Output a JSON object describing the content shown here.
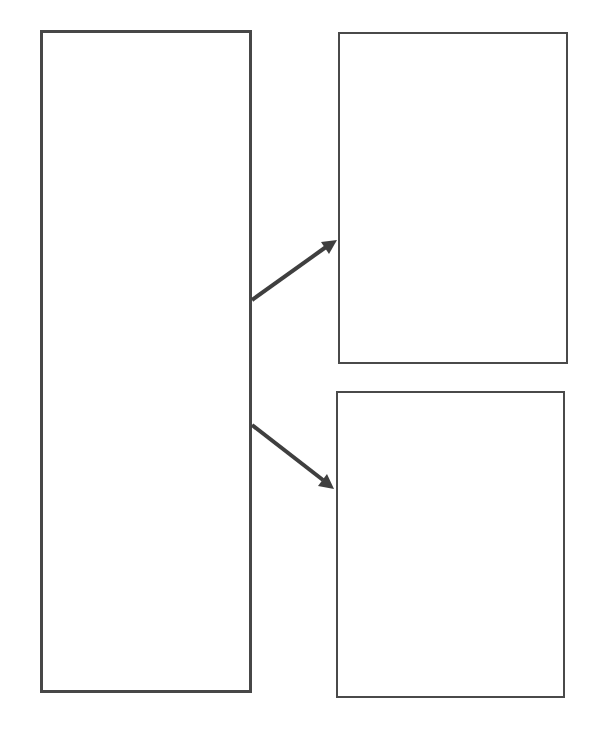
{
  "diagram": {
    "boxes": [
      {
        "id": "left-box",
        "label": ""
      },
      {
        "id": "top-right-box",
        "label": ""
      },
      {
        "id": "bottom-right-box",
        "label": ""
      }
    ],
    "arrows": [
      {
        "from": "left-box",
        "to": "top-right-box"
      },
      {
        "from": "left-box",
        "to": "bottom-right-box"
      }
    ],
    "colors": {
      "stroke": "#474747",
      "background": "#ffffff"
    }
  }
}
